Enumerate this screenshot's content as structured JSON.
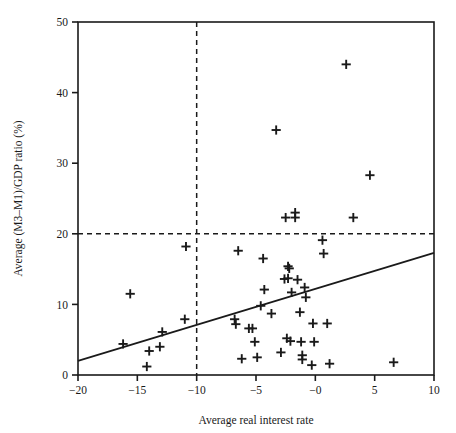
{
  "chart_data": {
    "type": "scatter",
    "title": "",
    "xlabel": "Average real interest rate",
    "ylabel": "Average (M3–M1)/GDP ratio (%)",
    "xlim": [
      -20,
      10
    ],
    "ylim": [
      0,
      50
    ],
    "xticks": [
      -20,
      -15,
      -10,
      -5,
      0,
      5,
      10
    ],
    "xtick_labels": [
      "−20",
      "−15",
      "−10",
      "−5",
      "−0",
      "5",
      "10"
    ],
    "yticks": [
      0,
      10,
      20,
      30,
      40,
      50
    ],
    "ytick_labels": [
      "0",
      "10",
      "20",
      "30",
      "40",
      "50"
    ],
    "grid": false,
    "legend": null,
    "marker": "plus",
    "marker_color": "#1a1a1a",
    "line_color": "#1a1a1a",
    "reference_lines": [
      {
        "name": "vertical-threshold",
        "orientation": "vertical",
        "value": -10,
        "style": "dashed"
      },
      {
        "name": "horizontal-threshold",
        "orientation": "horizontal",
        "value": 20,
        "style": "dashed"
      }
    ],
    "fit_line": {
      "name": "regression-line",
      "style": "solid",
      "x": [
        -20,
        10
      ],
      "y": [
        2.0,
        17.3
      ]
    },
    "points": [
      {
        "x": -16.2,
        "y": 4.4
      },
      {
        "x": -15.6,
        "y": 11.5
      },
      {
        "x": -14.2,
        "y": 1.2
      },
      {
        "x": -14.0,
        "y": 3.4
      },
      {
        "x": -13.1,
        "y": 4.0
      },
      {
        "x": -12.9,
        "y": 6.1
      },
      {
        "x": -11.0,
        "y": 7.9
      },
      {
        "x": -10.9,
        "y": 18.2
      },
      {
        "x": -6.8,
        "y": 7.9
      },
      {
        "x": -6.7,
        "y": 7.2
      },
      {
        "x": -6.5,
        "y": 17.6
      },
      {
        "x": -6.2,
        "y": 2.3
      },
      {
        "x": -5.6,
        "y": 6.6
      },
      {
        "x": -5.3,
        "y": 6.6
      },
      {
        "x": -5.1,
        "y": 4.7
      },
      {
        "x": -4.9,
        "y": 2.5
      },
      {
        "x": -4.6,
        "y": 9.8
      },
      {
        "x": -4.4,
        "y": 16.5
      },
      {
        "x": -4.3,
        "y": 12.1
      },
      {
        "x": -3.7,
        "y": 8.7
      },
      {
        "x": -3.3,
        "y": 34.7
      },
      {
        "x": -2.9,
        "y": 3.2
      },
      {
        "x": -2.6,
        "y": 13.6
      },
      {
        "x": -2.5,
        "y": 22.3
      },
      {
        "x": -2.4,
        "y": 5.2
      },
      {
        "x": -2.3,
        "y": 13.7
      },
      {
        "x": -2.3,
        "y": 15.4
      },
      {
        "x": -2.2,
        "y": 15.1
      },
      {
        "x": -2.1,
        "y": 4.8
      },
      {
        "x": -2.0,
        "y": 11.7
      },
      {
        "x": -1.7,
        "y": 23.0
      },
      {
        "x": -1.7,
        "y": 22.3
      },
      {
        "x": -1.5,
        "y": 13.5
      },
      {
        "x": -1.3,
        "y": 8.9
      },
      {
        "x": -1.2,
        "y": 4.7
      },
      {
        "x": -1.1,
        "y": 2.8
      },
      {
        "x": -1.1,
        "y": 2.2
      },
      {
        "x": -0.9,
        "y": 12.4
      },
      {
        "x": -0.8,
        "y": 11.0
      },
      {
        "x": -0.3,
        "y": 1.4
      },
      {
        "x": -0.2,
        "y": 7.3
      },
      {
        "x": -0.1,
        "y": 4.7
      },
      {
        "x": 0.6,
        "y": 19.1
      },
      {
        "x": 0.7,
        "y": 17.2
      },
      {
        "x": 1.0,
        "y": 7.3
      },
      {
        "x": 1.2,
        "y": 1.6
      },
      {
        "x": 2.6,
        "y": 44.0
      },
      {
        "x": 3.2,
        "y": 22.3
      },
      {
        "x": 4.6,
        "y": 28.3
      },
      {
        "x": 6.6,
        "y": 1.8
      }
    ]
  }
}
